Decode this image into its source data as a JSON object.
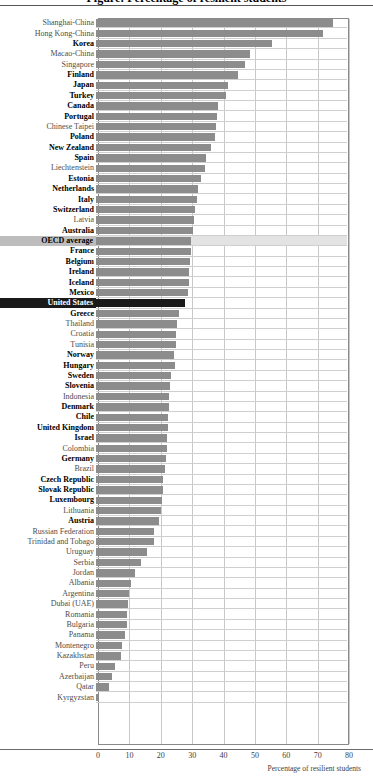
{
  "figure": {
    "cut_title": "Figure: Percentage of resilient students",
    "xlabel": "Percentage of resilient students"
  },
  "axis": {
    "ticks": [
      "0",
      "10",
      "20",
      "30",
      "40",
      "50",
      "60",
      "70",
      "80"
    ]
  },
  "chart_data": {
    "type": "bar",
    "orientation": "horizontal",
    "title": "",
    "xlabel": "Percentage of resilient students",
    "ylabel": "",
    "xlim": [
      0,
      80
    ],
    "grid": true,
    "legend": null,
    "categories": [
      "Shanghai-China",
      "Hong Kong-China",
      "Korea",
      "Macao-China",
      "Singapore",
      "Finland",
      "Japan",
      "Turkey",
      "Canada",
      "Portugal",
      "Chinese Taipei",
      "Poland",
      "New Zealand",
      "Spain",
      "Liechtenstein",
      "Estonia",
      "Netherlands",
      "Italy",
      "Switzerland",
      "Latvia",
      "Australia",
      "OECD average",
      "France",
      "Belgium",
      "Ireland",
      "Iceland",
      "Mexico",
      "United States",
      "Greece",
      "Thailand",
      "Croatia",
      "Tunisia",
      "Norway",
      "Hungary",
      "Sweden",
      "Slovenia",
      "Indonesia",
      "Denmark",
      "Chile",
      "United Kingdom",
      "Israel",
      "Colombia",
      "Germany",
      "Brazil",
      "Czech Republic",
      "Slovak Republic",
      "Luxembourg",
      "Lithuania",
      "Austria",
      "Russian Federation",
      "Trinidad and Tobago",
      "Uruguay",
      "Serbia",
      "Jordan",
      "Albania",
      "Argentina",
      "Dubai (UAE)",
      "Romania",
      "Bulgaria",
      "Panama",
      "Montenegro",
      "Kazakhstan",
      "Peru",
      "Azerbaijan",
      "Qatar",
      "Kyrgyzstan"
    ],
    "values": [
      75.6,
      72.4,
      56.0,
      49.0,
      47.5,
      45.2,
      42.0,
      41.5,
      38.8,
      38.6,
      38.3,
      37.8,
      36.7,
      35.2,
      34.8,
      33.6,
      32.6,
      32.2,
      31.5,
      31.2,
      31.0,
      30.3,
      30.2,
      29.9,
      29.8,
      29.6,
      29.4,
      28.5,
      26.4,
      25.7,
      25.5,
      25.4,
      24.8,
      25.2,
      23.8,
      23.6,
      23.3,
      23.2,
      23.0,
      22.8,
      22.6,
      22.5,
      22.3,
      22.0,
      21.5,
      21.3,
      21.0,
      20.7,
      20.2,
      18.6,
      18.5,
      16.2,
      14.2,
      12.4,
      11.0,
      10.6,
      10.2,
      9.9,
      9.8,
      9.2,
      8.4,
      8.0,
      6.2,
      5.2,
      4.2,
      0.7
    ],
    "highlights": {
      "OECD average": "grey-band",
      "United States": "black-bar"
    },
    "oecd_members": [
      "Korea",
      "Finland",
      "Japan",
      "Turkey",
      "Canada",
      "Portugal",
      "Poland",
      "New Zealand",
      "Spain",
      "Estonia",
      "Netherlands",
      "Italy",
      "Switzerland",
      "Australia",
      "OECD average",
      "France",
      "Belgium",
      "Ireland",
      "Iceland",
      "Mexico",
      "United States",
      "Greece",
      "Norway",
      "Hungary",
      "Sweden",
      "Slovenia",
      "Denmark",
      "Chile",
      "United Kingdom",
      "Israel",
      "Germany",
      "Czech Republic",
      "Slovak Republic",
      "Luxembourg",
      "Austria"
    ]
  }
}
